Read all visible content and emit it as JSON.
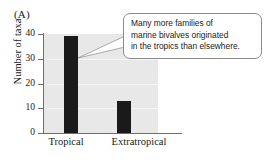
{
  "panel": {
    "label": "(A)"
  },
  "callout": {
    "name": "annotation-callout",
    "lines": [
      "Many more families of",
      "marine bivalves originated",
      "in the tropics than elsewhere."
    ]
  },
  "colors": {
    "bar": "#1a1a1a",
    "plot_background": "#e8e8e8",
    "gridline": "#f5f5f5",
    "axis": "#6e6e6e",
    "callout_border": "#8a8a8a",
    "callout_background": "#ffffff",
    "text": "#1a1a1a"
  },
  "chart_data": {
    "type": "bar",
    "title": "",
    "subtitle": "",
    "xlabel": "",
    "ylabel": "Number of taxa",
    "categories": [
      "Tropical",
      "Extratropical"
    ],
    "values": [
      39,
      13
    ],
    "ylim": [
      0,
      40
    ],
    "yticks": [
      0,
      10,
      20,
      30,
      40
    ],
    "ytick_labels": [
      "0",
      "10",
      "20",
      "30",
      "40"
    ],
    "grid": true,
    "legend": "none",
    "annotations": [
      "Many more families of marine bivalves originated in the tropics than elsewhere."
    ]
  }
}
